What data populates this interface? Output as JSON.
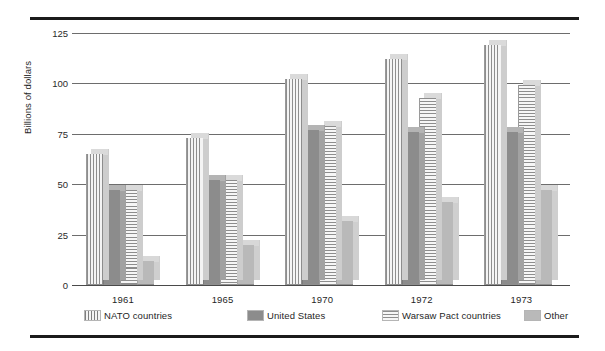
{
  "chart_data": {
    "type": "bar",
    "title": "",
    "subtitle": "",
    "xlabel": "",
    "ylabel": "Billions of dollars",
    "categories": [
      "1961",
      "1965",
      "1970",
      "1972",
      "1973"
    ],
    "ylim": [
      0,
      125
    ],
    "yticks": [
      0,
      25,
      50,
      75,
      100,
      125
    ],
    "ytick_labels": [
      "0",
      "25",
      "50",
      "75",
      "100",
      "125"
    ],
    "grid": true,
    "legend_position": "below-axis",
    "series": [
      {
        "name": "NATO countries",
        "pattern": "vertical-stripes",
        "color": "#f2f2f2",
        "values": [
          65,
          73,
          102,
          112,
          119
        ]
      },
      {
        "name": "United States",
        "pattern": "solid-dark",
        "color": "#8c8c8c",
        "values": [
          47,
          52,
          77,
          76,
          76
        ]
      },
      {
        "name": "Warsaw Pact countries",
        "pattern": "horizontal-stripes",
        "color": "#f4f4f4",
        "values": [
          47,
          52,
          79,
          93,
          99
        ]
      },
      {
        "name": "Other",
        "pattern": "solid-light",
        "color": "#b9b9b9",
        "values": [
          12,
          20,
          32,
          41,
          47
        ]
      }
    ]
  },
  "legend": {
    "items": [
      {
        "label": "NATO countries"
      },
      {
        "label": "United States"
      },
      {
        "label": "Warsaw Pact countries"
      },
      {
        "label": "Other"
      }
    ]
  },
  "axis": {
    "y_title": "Billions of dollars",
    "y_labels": [
      "125",
      "100",
      "75",
      "50",
      "25",
      "0"
    ],
    "x_labels": [
      "1961",
      "1965",
      "1970",
      "1972",
      "1973"
    ]
  },
  "colors": {
    "rule": "#1b1b1b",
    "gridline": "#6d6d6d",
    "text": "#1f1f1f",
    "bar_solid_dark": "#8c8c8c",
    "bar_solid_light": "#b9b9b9",
    "bar_stripe": "#8d8d8d",
    "bar_face": "#f3f3f3",
    "bar_side": "#c9c9c9",
    "bar_top": "#dcdcdc"
  }
}
